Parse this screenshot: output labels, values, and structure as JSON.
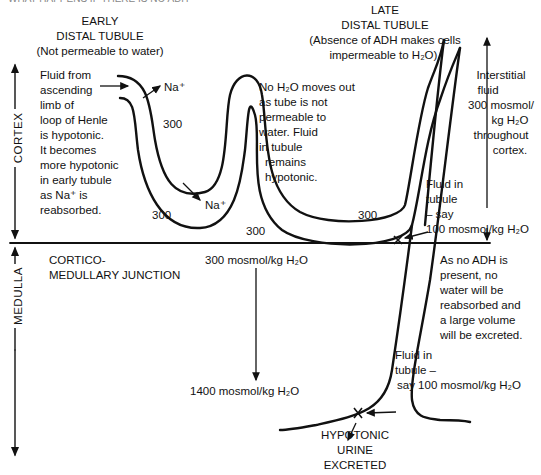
{
  "diagram": {
    "title_clipped": "WHAT HAPPENS IF THERE IS NO ADH",
    "early_tubule": {
      "heading_line1": "EARLY",
      "heading_line2": "DISTAL TUBULE",
      "heading_note": "(Not permeable to water)"
    },
    "late_tubule": {
      "heading_line1": "LATE",
      "heading_line2": "DISTAL TUBULE",
      "heading_note_line1": "(Absence of ADH makes cells",
      "heading_note_line2": "impermeable to H₂O)."
    },
    "left_note": [
      "Fluid from",
      "ascending",
      "limb of",
      "loop of Henle",
      "is hypotonic.",
      "It becomes",
      "more hypotonic",
      "in early tubule",
      "as Na⁺ is",
      "reabsorbed."
    ],
    "middle_note": [
      "No H₂O moves out",
      "as tube is not",
      "permeable to",
      "water. Fluid",
      "in tubule",
      "remains",
      "hypotonic."
    ],
    "interstitial_note": [
      "Interstitial",
      "fluid",
      "300 mosmol/",
      "kg H₂O",
      "throughout",
      "cortex."
    ],
    "fluid_note_upper": [
      "Fluid in",
      "tubule",
      "– say",
      "100 mosmol/kg H₂O"
    ],
    "adh_note": [
      "As no ADH is",
      "present, no",
      "water will be",
      "reabsorbed and",
      "a large volume",
      "will be excreted."
    ],
    "fluid_note_lower": [
      "Fluid in",
      "tubule –",
      "say 100 mosmol/kg H₂O"
    ],
    "urine_label": [
      "HYPOTONIC",
      "URINE",
      "EXCRETED"
    ],
    "junction_label": [
      "CORTICO-",
      "MEDULLARY JUNCTION"
    ],
    "osmolality_top": "300 mosmol/kg H₂O",
    "osmolality_bottom": "1400 mosmol/kg H₂O",
    "na_label_1": "Na⁺",
    "na_label_2": "Na⁺",
    "values_300": [
      "300",
      "300",
      "300",
      "300"
    ],
    "region_cortex": "CORTEX",
    "region_medulla": "MEDULLA"
  }
}
